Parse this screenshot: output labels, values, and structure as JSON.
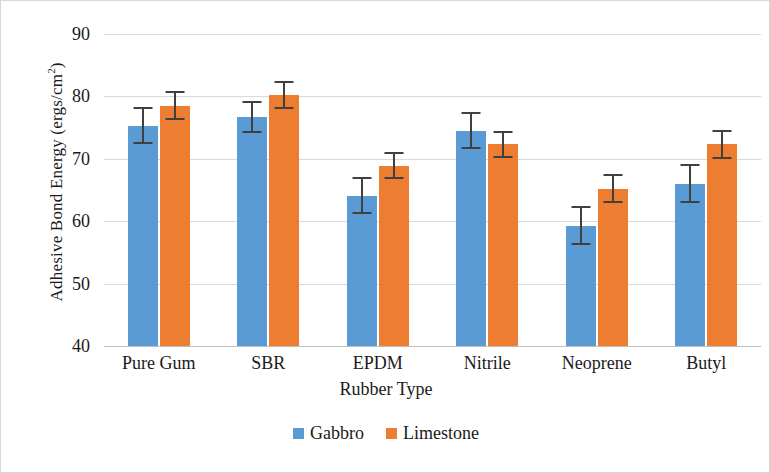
{
  "chart_data": {
    "type": "bar",
    "title": "",
    "xlabel": "Rubber Type",
    "ylabel": "Adhesive Bond Energy (ergs/cm2)",
    "ylabel_main": "Adhesive Bond Energy (ergs/cm",
    "ylabel_sup": "2",
    "ylabel_tail": ")",
    "categories": [
      "Pure Gum",
      "SBR",
      "EPDM",
      "Nitrile",
      "Neoprene",
      "Butyl"
    ],
    "ylim": [
      40,
      90
    ],
    "yticks": [
      40,
      50,
      60,
      70,
      80,
      90
    ],
    "ytick_labels": [
      "40",
      "50",
      "60",
      "70",
      "80",
      "90"
    ],
    "grid": true,
    "legend_position": "bottom",
    "series": [
      {
        "name": "Gabbro",
        "color": "#5B9BD5",
        "values": [
          75.3,
          76.7,
          64.1,
          74.5,
          59.3,
          66.0
        ],
        "errors": [
          3.0,
          2.6,
          3.0,
          3.0,
          3.1,
          3.1
        ]
      },
      {
        "name": "Limestone",
        "color": "#ED7D31",
        "values": [
          78.5,
          80.2,
          68.9,
          72.3,
          65.2,
          72.3
        ],
        "errors": [
          2.3,
          2.2,
          2.2,
          2.2,
          2.3,
          2.3
        ]
      }
    ]
  },
  "legend": {
    "items": [
      {
        "label": "Gabbro",
        "color": "#5B9BD5"
      },
      {
        "label": "Limestone",
        "color": "#ED7D31"
      }
    ]
  }
}
